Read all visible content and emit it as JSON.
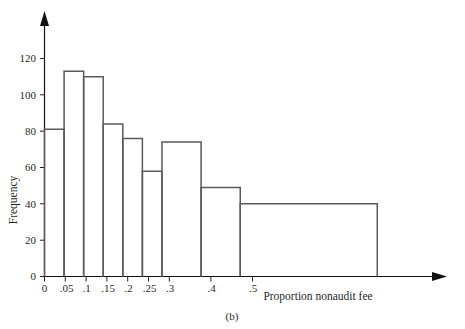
{
  "figure": {
    "caption": "(b)",
    "xlabel": "Proportion nonaudit fee",
    "ylabel": "Frequency"
  },
  "chart_data": {
    "type": "bar",
    "title": "",
    "subtitle": "",
    "xlabel": "Proportion nonaudit fee",
    "ylabel": "Frequency",
    "grid": false,
    "legend": "none",
    "annotations": [
      "(b)"
    ],
    "bin_edges": [
      0,
      0.05,
      0.1,
      0.15,
      0.2,
      0.25,
      0.3,
      0.4,
      0.5,
      0.85
    ],
    "categories": [
      "0–.05",
      ".05–.1",
      ".1–.15",
      ".15–.2",
      ".2–.25",
      ".25–.3",
      ".3–.4",
      ".4–.5",
      ".5–.85"
    ],
    "values": [
      81,
      113,
      110,
      84,
      76,
      58,
      74,
      49,
      40
    ],
    "xtick_labels": [
      "0",
      ".05",
      ".1",
      ".15",
      ".2",
      ".25",
      ".3",
      ".4",
      ".5"
    ],
    "xtick_values": [
      0,
      0.05,
      0.1,
      0.15,
      0.2,
      0.25,
      0.3,
      0.4,
      0.5
    ],
    "ytick_labels": [
      "0",
      "20",
      "40",
      "60",
      "80",
      "100",
      "120"
    ],
    "ytick_values": [
      0,
      20,
      40,
      60,
      80,
      100,
      120
    ],
    "xlim": [
      0,
      1.0
    ],
    "ylim": [
      0,
      132
    ]
  },
  "colors": {
    "bar_outline": "#5a5a5a",
    "axis": "#111111",
    "text": "#1f1f1f",
    "background": "#ffffff"
  }
}
